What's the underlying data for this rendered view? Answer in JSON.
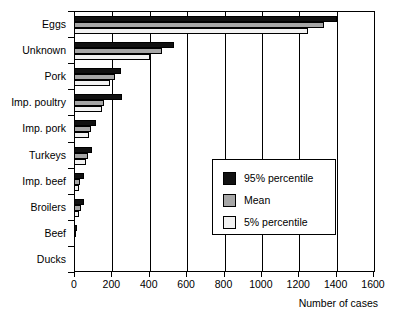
{
  "chart_data": {
    "type": "bar",
    "orientation": "horizontal",
    "title": "",
    "xlabel": "Number of cases",
    "ylabel": "",
    "xlim": [
      0,
      1600
    ],
    "xticks": [
      0,
      200,
      400,
      600,
      800,
      1000,
      1200,
      1400,
      1600
    ],
    "grid": true,
    "grid_axis": "x",
    "legend_position": "center-right",
    "categories": [
      "Eggs",
      "Unknown",
      "Pork",
      "Imp. poultry",
      "Imp. pork",
      "Turkeys",
      "Imp. beef",
      "Broilers",
      "Beef",
      "Ducks"
    ],
    "series": [
      {
        "name": "95% percentile",
        "color": "#111111",
        "values": [
          1400,
          530,
          245,
          250,
          110,
          90,
          50,
          50,
          12,
          2
        ]
      },
      {
        "name": "Mean",
        "color": "#a6a6a6",
        "values": [
          1330,
          465,
          212,
          155,
          88,
          70,
          28,
          30,
          6,
          1
        ]
      },
      {
        "name": "5% percentile",
        "color": "#f2f2f2",
        "values": [
          1245,
          400,
          185,
          145,
          75,
          58,
          22,
          22,
          4,
          0
        ]
      }
    ]
  },
  "legend": {
    "entries": [
      {
        "label": "95% percentile",
        "swatch": "p95"
      },
      {
        "label": "Mean",
        "swatch": "mean"
      },
      {
        "label": "5% percentile",
        "swatch": "p05"
      }
    ]
  },
  "axis": {
    "x_title": "Number of cases"
  }
}
